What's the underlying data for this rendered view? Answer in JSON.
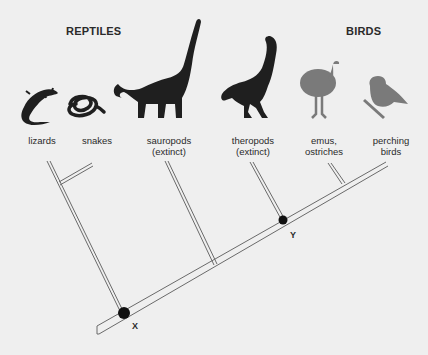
{
  "groups": {
    "reptiles": "REPTILES",
    "birds": "BIRDS"
  },
  "taxa": [
    {
      "id": "lizards",
      "line1": "lizards",
      "line2": "",
      "icon": "lizard-icon",
      "color": "#1f1f1f"
    },
    {
      "id": "snakes",
      "line1": "snakes",
      "line2": "",
      "icon": "snake-icon",
      "color": "#1f1f1f"
    },
    {
      "id": "sauropods",
      "line1": "sauropods",
      "line2": "(extinct)",
      "icon": "sauropod-icon",
      "color": "#1f1f1f"
    },
    {
      "id": "theropods",
      "line1": "theropods",
      "line2": "(extinct)",
      "icon": "theropod-icon",
      "color": "#1f1f1f"
    },
    {
      "id": "emus",
      "line1": "emus,",
      "line2": "ostriches",
      "icon": "ostrich-icon",
      "color": "#7a7a7a"
    },
    {
      "id": "perching",
      "line1": "perching",
      "line2": "birds",
      "icon": "perching-bird-icon",
      "color": "#7a7a7a"
    }
  ],
  "nodes": {
    "x": "X",
    "y": "Y"
  },
  "colors": {
    "background": "#efefef",
    "silhouette_reptile": "#1f1f1f",
    "silhouette_bird": "#7a7a7a",
    "branch": "#6a6a6a",
    "node": "#111111"
  }
}
